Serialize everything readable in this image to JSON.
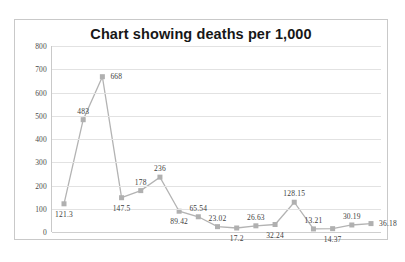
{
  "chart_data": {
    "type": "line",
    "title": "Chart showing deaths per 1,000",
    "xlabel": "",
    "ylabel": "",
    "ylim": [
      0,
      800
    ],
    "ytick_labels": [
      "800",
      "700",
      "600",
      "500",
      "400",
      "300",
      "200",
      "100",
      "0"
    ],
    "yticks": [
      800,
      700,
      600,
      500,
      400,
      300,
      200,
      100,
      0
    ],
    "grid": true,
    "legend": false,
    "marker": "square",
    "series_color": "#b3b3b3",
    "marker_color": "#b0b0b0",
    "data_labels_shown": true,
    "categories": [
      "1",
      "2",
      "3",
      "4",
      "5",
      "6",
      "7",
      "8",
      "9",
      "10",
      "11",
      "12",
      "13",
      "14",
      "15",
      "16",
      "17"
    ],
    "values": [
      121.3,
      483,
      668,
      147.5,
      178,
      236,
      89.42,
      65.54,
      23.02,
      17.2,
      26.63,
      32.24,
      128.15,
      13.21,
      14.37,
      30.19,
      36.18
    ],
    "point_labels": [
      "121.3",
      "483",
      "668",
      "147.5",
      "178",
      "236",
      "89.42",
      "65.54",
      "23.02",
      "17.2",
      "26.63",
      "32.24",
      "128.15",
      "13.21",
      "14.37",
      "30.19",
      "36.18"
    ],
    "label_positions": [
      "below",
      "above",
      "right",
      "below",
      "above",
      "above",
      "below",
      "above",
      "above",
      "below",
      "above",
      "below",
      "above",
      "above",
      "below",
      "above",
      "right"
    ]
  },
  "colors": {
    "title_text": "#171717",
    "axis_text": "#4a4a4a",
    "gridline": "#e2e2e2",
    "border": "#c9c9c9",
    "series": "#b3b3b3",
    "background": "#ffffff"
  }
}
